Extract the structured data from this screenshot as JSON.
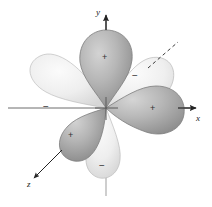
{
  "figure": {
    "background": "#ffffff",
    "width": 212,
    "height": 207
  },
  "axes": [
    {
      "id": "x",
      "label": "x",
      "direction": "right",
      "arrow": true,
      "style": "solid"
    },
    {
      "id": "y",
      "label": "y",
      "direction": "up",
      "arrow": true,
      "style": "solid"
    },
    {
      "id": "z",
      "label": "z",
      "direction": "lower-left",
      "arrow": true,
      "style": "solid"
    }
  ],
  "guides": [
    {
      "id": "rear-lobe-pointer",
      "style": "dashed",
      "direction": "upper-right"
    }
  ],
  "lobes": [
    {
      "id": "lobe-top",
      "sign": "+",
      "shade": "dark",
      "position": "top",
      "fill_light": "#c9c9c9",
      "fill_dark": "#8d8d8d"
    },
    {
      "id": "lobe-right",
      "sign": "+",
      "shade": "dark",
      "position": "right",
      "fill_light": "#c9c9c9",
      "fill_dark": "#8d8d8d"
    },
    {
      "id": "lobe-lower-left",
      "sign": "+",
      "shade": "dark",
      "position": "lower-left",
      "fill_light": "#c4c4c4",
      "fill_dark": "#8a8a8a"
    },
    {
      "id": "lobe-left",
      "sign": "−",
      "shade": "light",
      "position": "left",
      "fill_light": "#f2f2f2",
      "fill_dark": "#dcdcdc"
    },
    {
      "id": "lobe-upper-right",
      "sign": "−",
      "shade": "light",
      "position": "upper-right",
      "fill_light": "#f2f2f2",
      "fill_dark": "#dddddd"
    },
    {
      "id": "lobe-lower-right",
      "sign": "−",
      "shade": "light",
      "position": "lower-right",
      "fill_light": "#f2f2f2",
      "fill_dark": "#dcdcdc"
    }
  ],
  "colors": {
    "axis_line": "#4a4a4a",
    "outline": "#9a9a9a",
    "sign_text": "#333333",
    "label_text": "#1a1a1a"
  }
}
